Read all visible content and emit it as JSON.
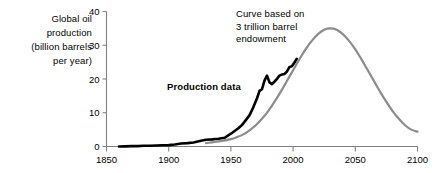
{
  "chart_data": {
    "type": "line",
    "title": "",
    "subtitle": "",
    "xlabel": "",
    "ylabel": "Global oil production (billion barrels per year)",
    "xlim": [
      1850,
      2100
    ],
    "ylim": [
      0,
      40
    ],
    "grid": false,
    "legend_position": "inline-annotations",
    "xticks": [
      1850,
      1900,
      1950,
      2000,
      2050,
      2100
    ],
    "xtick_labels": [
      "1850",
      "1900",
      "1950",
      "2000",
      "2050",
      "2100"
    ],
    "yticks": [
      0,
      10,
      20,
      30,
      40
    ],
    "ytick_labels": [
      "0",
      "10",
      "20",
      "30",
      "40"
    ],
    "annotations": [
      {
        "name": "endowment-annotation",
        "lines": [
          "Curve based on",
          "3 trillion barrel",
          "endowment"
        ],
        "target_series": "model-curve"
      },
      {
        "name": "production-data-annotation",
        "lines": [
          "Production data"
        ],
        "bold": true,
        "target_series": "production-data"
      }
    ],
    "series": [
      {
        "name": "Production data",
        "id": "production-data",
        "color": "#000000",
        "width": 2.6,
        "x": [
          1860,
          1865,
          1870,
          1875,
          1880,
          1885,
          1890,
          1895,
          1900,
          1905,
          1910,
          1915,
          1920,
          1925,
          1930,
          1935,
          1940,
          1945,
          1950,
          1953,
          1956,
          1959,
          1962,
          1965,
          1968,
          1971,
          1973,
          1975,
          1977,
          1979,
          1981,
          1983,
          1985,
          1987,
          1989,
          1991,
          1993,
          1995,
          1997,
          1999,
          2001,
          2003
        ],
        "y": [
          0.0,
          0.05,
          0.1,
          0.1,
          0.2,
          0.2,
          0.3,
          0.35,
          0.4,
          0.6,
          0.9,
          1.0,
          1.2,
          1.6,
          2.0,
          2.1,
          2.3,
          2.6,
          3.8,
          4.6,
          5.4,
          6.4,
          7.8,
          9.3,
          11.6,
          14.3,
          16.5,
          17.0,
          19.5,
          21.0,
          19.0,
          18.5,
          19.2,
          20.0,
          21.0,
          21.3,
          21.5,
          22.2,
          23.5,
          23.8,
          24.8,
          26.0
        ]
      },
      {
        "name": "Curve based on 3 trillion barrel endowment",
        "id": "model-curve",
        "color": "#8c8c8c",
        "width": 2.2,
        "peak_year": 2030,
        "peak_value": 35,
        "endowment_trillion_barrels": 3,
        "x": [
          1930,
          1940,
          1950,
          1955,
          1960,
          1965,
          1970,
          1975,
          1980,
          1985,
          1990,
          1995,
          2000,
          2005,
          2010,
          2015,
          2020,
          2025,
          2030,
          2035,
          2040,
          2045,
          2050,
          2055,
          2060,
          2065,
          2070,
          2075,
          2080,
          2085,
          2090,
          2095,
          2100
        ],
        "y": [
          1.0,
          1.5,
          2.2,
          2.8,
          3.6,
          4.8,
          6.3,
          8.2,
          10.5,
          13.2,
          16.2,
          19.4,
          22.6,
          25.8,
          28.8,
          31.3,
          33.3,
          34.6,
          35.0,
          34.6,
          33.3,
          31.3,
          28.8,
          25.8,
          22.6,
          19.4,
          16.2,
          13.2,
          10.5,
          8.2,
          6.3,
          5.0,
          4.4
        ]
      }
    ]
  },
  "axis_label": {
    "lines": [
      "Global oil",
      "production",
      "(billion barrels",
      "per year)"
    ]
  },
  "colors": {
    "data_curve": "#000000",
    "model_curve": "#8c8c8c",
    "axis": "#808080",
    "text": "#000000",
    "background": "#ffffff"
  }
}
